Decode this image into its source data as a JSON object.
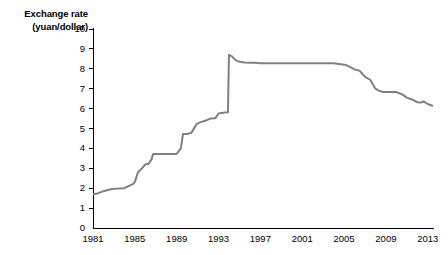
{
  "chart_data": {
    "type": "line",
    "title": "",
    "ylabel_lines": [
      "Exchange rate",
      "(yuan/dollar)"
    ],
    "ylabel": "Exchange rate (yuan/dollar)",
    "xlabel": "",
    "ylim": [
      0,
      10
    ],
    "xlim": [
      1981,
      2013.6
    ],
    "grid": false,
    "legend": null,
    "line_color": "#808080",
    "axis_color": "#000000",
    "yticks": [
      0,
      1,
      2,
      3,
      4,
      5,
      6,
      7,
      8,
      9,
      10
    ],
    "ytick_labels": [
      "0",
      "1",
      "2",
      "3",
      "4",
      "5",
      "6",
      "7",
      "8",
      "9",
      "10"
    ],
    "xticks": [
      1981,
      1985,
      1989,
      1993,
      1997,
      2001,
      2005,
      2009,
      2013
    ],
    "xtick_labels": [
      "1981",
      "1985",
      "1989",
      "1993",
      "1997",
      "2001",
      "2005",
      "2009",
      "2013"
    ],
    "series": [
      {
        "name": "USD/CNY exchange rate",
        "x": [
          1981.0,
          1981.5,
          1982.0,
          1982.5,
          1983.0,
          1983.5,
          1984.0,
          1984.4,
          1984.8,
          1985.0,
          1985.3,
          1985.6,
          1986.0,
          1986.3,
          1986.6,
          1986.75,
          1987.0,
          1989.0,
          1989.4,
          1989.6,
          1990.0,
          1990.4,
          1990.9,
          1991.3,
          1991.8,
          1992.2,
          1992.7,
          1993.0,
          1993.3,
          1993.6,
          1993.9,
          1994.0,
          1994.3,
          1994.6,
          1995.0,
          1995.5,
          1996.0,
          1996.5,
          1997.0,
          1998.0,
          1999.0,
          2000.0,
          2001.0,
          2002.0,
          2003.0,
          2004.0,
          2005.2,
          2005.6,
          2006.0,
          2006.5,
          2007.0,
          2007.5,
          2008.0,
          2008.4,
          2008.7,
          2009.0,
          2009.5,
          2010.0,
          2010.3,
          2010.6,
          2011.0,
          2011.5,
          2012.0,
          2012.3,
          2012.6,
          2013.0,
          2013.5
        ],
        "y": [
          1.7,
          1.75,
          1.85,
          1.92,
          1.97,
          1.98,
          2.0,
          2.1,
          2.2,
          2.32,
          2.8,
          2.95,
          3.2,
          3.22,
          3.45,
          3.72,
          3.72,
          3.72,
          4.0,
          4.72,
          4.72,
          4.78,
          5.22,
          5.32,
          5.4,
          5.5,
          5.52,
          5.75,
          5.78,
          5.8,
          5.82,
          8.7,
          8.62,
          8.45,
          8.35,
          8.32,
          8.31,
          8.3,
          8.28,
          8.28,
          8.28,
          8.28,
          8.28,
          8.28,
          8.28,
          8.28,
          8.19,
          8.08,
          7.97,
          7.9,
          7.6,
          7.45,
          7.0,
          6.88,
          6.84,
          6.83,
          6.83,
          6.83,
          6.77,
          6.7,
          6.55,
          6.46,
          6.32,
          6.3,
          6.36,
          6.23,
          6.13
        ]
      }
    ],
    "annotations": [
      {
        "label": "1994 devaluation spike peak",
        "value": 8.7
      },
      {
        "label": "fixed-peg plateau 1997-2005",
        "value": 8.28
      },
      {
        "label": "re-peg plateau 2009-2010",
        "value": 6.83
      },
      {
        "label": "final value 2013",
        "value": 6.13
      }
    ]
  }
}
